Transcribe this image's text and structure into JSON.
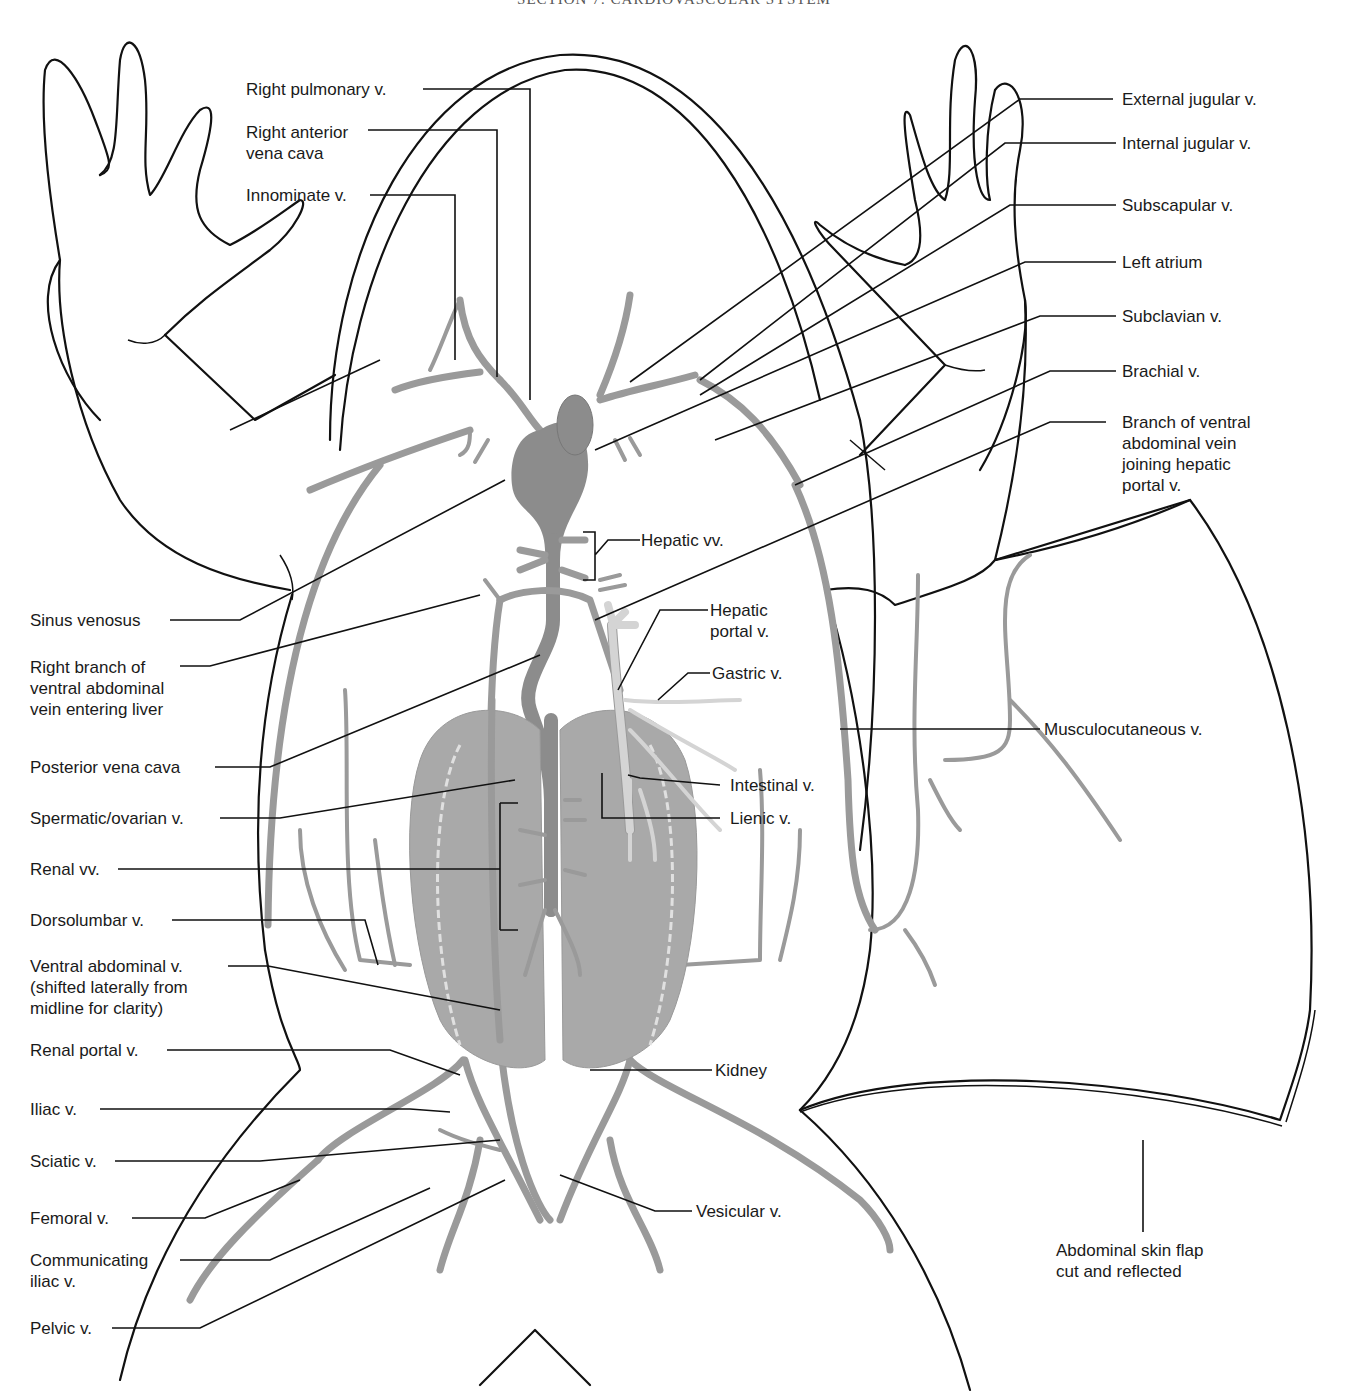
{
  "header": "SECTION 7: CARDIOVASCULAR SYSTEM",
  "figure": {
    "colors": {
      "outline": "#111111",
      "vein": "#9a9a9a",
      "sinus_venosus": "#8c8c8c",
      "kidney": "#a9a9a9",
      "hepatic_portal_system": "#d4d4d4",
      "background": "#ffffff"
    }
  },
  "labels": {
    "left": [
      {
        "id": "right-pulmonary-v",
        "text": "Right pulmonary v."
      },
      {
        "id": "right-anterior-vena-cava",
        "text": "Right anterior\nvena cava"
      },
      {
        "id": "innominate-v",
        "text": "Innominate v."
      },
      {
        "id": "sinus-venosus",
        "text": "Sinus venosus"
      },
      {
        "id": "right-branch-ventral-abdominal",
        "text": "Right branch of\nventral abdominal\nvein entering liver"
      },
      {
        "id": "posterior-vena-cava",
        "text": "Posterior vena cava"
      },
      {
        "id": "spermatic-ovarian-v",
        "text": "Spermatic/ovarian v."
      },
      {
        "id": "renal-vv",
        "text": "Renal vv."
      },
      {
        "id": "dorsolumbar-v",
        "text": "Dorsolumbar v."
      },
      {
        "id": "ventral-abdominal-v",
        "text": "Ventral abdominal v.\n(shifted laterally from\nmidline for clarity)"
      },
      {
        "id": "renal-portal-v",
        "text": "Renal portal v."
      },
      {
        "id": "iliac-v",
        "text": "Iliac v."
      },
      {
        "id": "sciatic-v",
        "text": "Sciatic v."
      },
      {
        "id": "femoral-v",
        "text": "Femoral v."
      },
      {
        "id": "communicating-iliac-v",
        "text": "Communicating\niliac v."
      },
      {
        "id": "pelvic-v",
        "text": "Pelvic v."
      }
    ],
    "right": [
      {
        "id": "external-jugular-v",
        "text": "External jugular v."
      },
      {
        "id": "internal-jugular-v",
        "text": "Internal jugular v."
      },
      {
        "id": "subscapular-v",
        "text": "Subscapular v."
      },
      {
        "id": "left-atrium",
        "text": "Left atrium"
      },
      {
        "id": "subclavian-v",
        "text": "Subclavian v."
      },
      {
        "id": "brachial-v",
        "text": "Brachial v."
      },
      {
        "id": "branch-ventral-abdominal-hepatic-portal",
        "text": "Branch of ventral\nabdominal vein\njoining hepatic\nportal v."
      },
      {
        "id": "musculocutaneous-v",
        "text": "Musculocutaneous v."
      },
      {
        "id": "abdominal-skin-flap",
        "text": "Abdominal skin flap\ncut and reflected"
      }
    ],
    "center": [
      {
        "id": "hepatic-vv",
        "text": "Hepatic vv."
      },
      {
        "id": "hepatic-portal-v",
        "text": "Hepatic\nportal v."
      },
      {
        "id": "gastric-v",
        "text": "Gastric v."
      },
      {
        "id": "intestinal-v",
        "text": "Intestinal v."
      },
      {
        "id": "lienic-v",
        "text": "Lienic v."
      },
      {
        "id": "kidney",
        "text": "Kidney"
      },
      {
        "id": "vesicular-v",
        "text": "Vesicular v."
      }
    ]
  }
}
